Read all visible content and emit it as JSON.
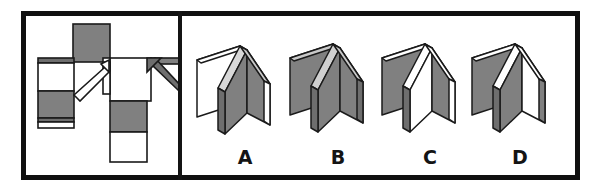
{
  "figure": {
    "description": "A flattened net of folded card panels on the left; four candidate folded three-dimensional results labelled A, B, C and D on the right.",
    "frame": {
      "border_color": "#101010",
      "background_color": "#ffffff",
      "divider_color": "#141414"
    }
  },
  "colors": {
    "outline": "#1a1a1a",
    "panel_gray": "#808080",
    "panel_gray_dark": "#6e6e6e",
    "panel_gray_light": "#9a9a9a",
    "panel_white": "#ffffff",
    "edge_shadow": "#585858",
    "label_color": "#141414"
  },
  "left_panel": {
    "name": "unfolded-net-diagram",
    "pieces": [
      {
        "id": "top-square",
        "fill": "gray",
        "note": "upper vertical tab above the hinge line"
      },
      {
        "id": "left-upper-square",
        "fill": "white",
        "note": "left arm, upper half"
      },
      {
        "id": "left-lower-square",
        "fill": "gray",
        "note": "left arm, lower half"
      },
      {
        "id": "center-square",
        "fill": "white",
        "note": "central panel right of the fold"
      },
      {
        "id": "bottom-upper-square",
        "fill": "gray",
        "note": "lower stem, upper half"
      },
      {
        "id": "bottom-lower-square",
        "fill": "white",
        "note": "lower stem, lower half"
      },
      {
        "id": "right-bar",
        "fill": "gray",
        "note": "horizontal bar extending to the right"
      }
    ],
    "arrows": [
      {
        "id": "fold-arrow-left",
        "style": "outline",
        "fill": "white",
        "direction": "up-right",
        "note": "hollow arrow indicating fold direction"
      },
      {
        "id": "fold-arrow-right",
        "style": "solid",
        "fill": "gray",
        "direction": "down-right",
        "note": "shaded arrow indicating fold direction"
      }
    ]
  },
  "right_panel": {
    "name": "answer-options",
    "options": [
      {
        "label": "A",
        "name": "option-a",
        "faces": {
          "left_panel": "white",
          "center_panel": "gray",
          "right_panel": "gray"
        },
        "note": "left leaf shows a white face, the two inner leaves are gray"
      },
      {
        "label": "B",
        "name": "option-b",
        "faces": {
          "left_panel": "gray",
          "center_panel": "gray",
          "right_panel": "gray"
        },
        "note": "all visible leaf faces are gray"
      },
      {
        "label": "C",
        "name": "option-c",
        "faces": {
          "left_panel": "gray",
          "center_panel": "white",
          "right_panel": "gray"
        },
        "note": "outer leaves gray with a white inner spine face"
      },
      {
        "label": "D",
        "name": "option-d",
        "faces": {
          "left_panel": "gray",
          "center_panel": "gray",
          "right_panel": "white"
        },
        "note": "left and middle leaves gray, right inner leaf white"
      }
    ]
  }
}
